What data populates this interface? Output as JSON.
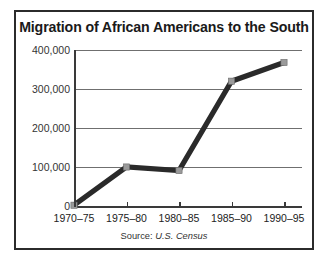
{
  "figure": {
    "title": "Migration of African Americans to the South",
    "source_prefix": "Source:",
    "source_name": "U.S. Census"
  },
  "colors": {
    "frame": "#2b2b2b",
    "line": "#2a2a2a",
    "marker": "#9a9a9a",
    "gridline": "#6f6f6f",
    "axis": "#3a3a3a",
    "text": "#1a1a1a",
    "background": "#ffffff"
  },
  "chart_data": {
    "type": "line",
    "title": "Migration of African Americans to the South",
    "xlabel": "",
    "ylabel": "",
    "categories": [
      "1970–75",
      "1975–80",
      "1980–85",
      "1985–90",
      "1990–95"
    ],
    "values": [
      2000,
      100000,
      91000,
      320000,
      368000
    ],
    "ylim": [
      0,
      400000
    ],
    "yticks": [
      0,
      100000,
      200000,
      300000,
      400000
    ],
    "ytick_labels": [
      "0",
      "100,000",
      "200,000",
      "300,000",
      "400,000"
    ],
    "grid": true,
    "legend": false,
    "annotations": [
      "Source: U.S. Census"
    ],
    "series": [
      {
        "name": "Net migration of African Americans to the South",
        "values": [
          2000,
          100000,
          91000,
          320000,
          368000
        ]
      }
    ]
  }
}
